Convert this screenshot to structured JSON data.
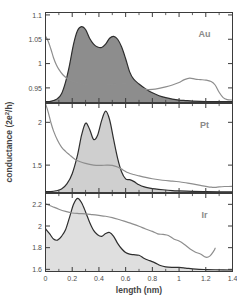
{
  "figure": {
    "xlabel": "length (nm)",
    "ylabel": "conductance (2e²/h)",
    "ylabel_main": "conductance (2e",
    "ylabel_sup": "2",
    "ylabel_tail": "/h)"
  },
  "chart_data": {
    "type": "line",
    "title": "",
    "xlabel": "length (nm)",
    "ylabel": "conductance (2e²/h)",
    "xlim": [
      0,
      1.4
    ],
    "xticks": [
      0,
      0.2,
      0.4,
      0.6,
      0.8,
      1,
      1.2,
      1.4
    ],
    "xticklabels": [
      "0",
      "0.2",
      "0.4",
      "0.6",
      "0.8",
      "1",
      "1.2",
      "1.4"
    ],
    "grid": false,
    "legend": "none",
    "panels": [
      {
        "label": "Au",
        "ylim": [
          0.92,
          1.105
        ],
        "yticks": [
          0.95,
          1,
          1.05,
          1.1
        ],
        "yticklabels": [
          "0.95",
          "1",
          "1.05",
          "1.1"
        ],
        "series": [
          {
            "name": "length histogram (Au)",
            "style": "filled-dark",
            "fill_color": "#8d8d8d",
            "line_color": "#2e2e2e",
            "x": [
              0.0,
              0.03,
              0.06,
              0.09,
              0.12,
              0.15,
              0.18,
              0.21,
              0.24,
              0.27,
              0.3,
              0.33,
              0.36,
              0.39,
              0.42,
              0.45,
              0.48,
              0.51,
              0.54,
              0.57,
              0.6,
              0.63,
              0.66,
              0.7,
              0.75,
              0.8,
              0.85,
              0.9,
              0.95,
              1.0,
              1.05,
              1.1,
              1.2,
              1.3,
              1.4
            ],
            "y": [
              0.922,
              0.922,
              0.924,
              0.928,
              0.938,
              0.962,
              0.997,
              1.04,
              1.068,
              1.076,
              1.07,
              1.052,
              1.04,
              1.034,
              1.033,
              1.04,
              1.052,
              1.056,
              1.05,
              1.034,
              1.01,
              0.983,
              0.968,
              0.958,
              0.948,
              0.94,
              0.934,
              0.93,
              0.927,
              0.925,
              0.924,
              0.923,
              0.922,
              0.922,
              0.922
            ]
          },
          {
            "name": "mean conductance trace (Au)",
            "style": "line-gray",
            "line_color": "#8e8e8e",
            "x": [
              0.0,
              0.02,
              0.04,
              0.06,
              0.08,
              0.1,
              0.13,
              0.16,
              0.2,
              0.25,
              0.3,
              0.35,
              0.4,
              0.45,
              0.5,
              0.55,
              0.6,
              0.65,
              0.7,
              0.75,
              0.8,
              0.85,
              0.9,
              0.95,
              1.0,
              1.04,
              1.08,
              1.12,
              1.16,
              1.2,
              1.24,
              1.27,
              1.3,
              1.33,
              1.36,
              1.4
            ],
            "y": [
              1.056,
              1.046,
              1.03,
              1.012,
              0.998,
              0.988,
              0.977,
              0.97,
              0.964,
              0.96,
              0.957,
              0.956,
              0.956,
              0.956,
              0.957,
              0.958,
              0.959,
              0.957,
              0.951,
              0.947,
              0.947,
              0.949,
              0.952,
              0.956,
              0.961,
              0.967,
              0.97,
              0.968,
              0.967,
              0.966,
              0.963,
              0.956,
              0.941,
              0.93,
              0.926,
              0.925
            ]
          }
        ]
      },
      {
        "label": "Pt",
        "ylim": [
          1.18,
          2.22
        ],
        "yticks": [
          1.5,
          2
        ],
        "yticklabels": [
          "1.5",
          "2"
        ],
        "series": [
          {
            "name": "length histogram (Pt)",
            "style": "filled-light",
            "fill_color": "#cfcfcf",
            "line_color": "#2e2e2e",
            "x": [
              0.0,
              0.04,
              0.08,
              0.12,
              0.16,
              0.2,
              0.24,
              0.27,
              0.3,
              0.33,
              0.36,
              0.39,
              0.42,
              0.45,
              0.48,
              0.51,
              0.54,
              0.57,
              0.6,
              0.63,
              0.66,
              0.7,
              0.74,
              0.78,
              0.82,
              0.88,
              0.95,
              1.0,
              1.1,
              1.2,
              1.3,
              1.4
            ],
            "y": [
              1.19,
              1.19,
              1.2,
              1.22,
              1.28,
              1.4,
              1.62,
              1.85,
              1.99,
              1.92,
              1.8,
              1.85,
              2.02,
              2.13,
              2.03,
              1.8,
              1.58,
              1.42,
              1.34,
              1.33,
              1.31,
              1.27,
              1.245,
              1.232,
              1.222,
              1.212,
              1.203,
              1.199,
              1.193,
              1.19,
              1.188,
              1.188
            ]
          },
          {
            "name": "mean conductance trace (Pt)",
            "style": "line-gray",
            "line_color": "#8e8e8e",
            "x": [
              0.0,
              0.02,
              0.04,
              0.06,
              0.09,
              0.12,
              0.15,
              0.18,
              0.22,
              0.26,
              0.3,
              0.34,
              0.38,
              0.42,
              0.46,
              0.5,
              0.54,
              0.58,
              0.62,
              0.66,
              0.7,
              0.75,
              0.8,
              0.85,
              0.9,
              0.95,
              1.0,
              1.05,
              1.1,
              1.15,
              1.2,
              1.24,
              1.27,
              1.3,
              1.34,
              1.37,
              1.4
            ],
            "y": [
              2.22,
              2.12,
              2.0,
              1.9,
              1.79,
              1.71,
              1.66,
              1.62,
              1.57,
              1.54,
              1.52,
              1.505,
              1.497,
              1.497,
              1.5,
              1.497,
              1.478,
              1.444,
              1.41,
              1.39,
              1.374,
              1.356,
              1.341,
              1.329,
              1.32,
              1.314,
              1.306,
              1.294,
              1.28,
              1.266,
              1.252,
              1.242,
              1.24,
              1.246,
              1.25,
              1.25,
              1.252
            ]
          }
        ]
      },
      {
        "label": "Ir",
        "ylim": [
          1.58,
          2.3
        ],
        "yticks": [
          1.6,
          1.8,
          2,
          2.2
        ],
        "yticklabels": [
          "1.6",
          "1.8",
          "2",
          "2.2"
        ],
        "series": [
          {
            "name": "length histogram (Ir)",
            "style": "filled-light",
            "fill_color": "#dfdfdf",
            "line_color": "#2e2e2e",
            "x": [
              0.0,
              0.03,
              0.06,
              0.09,
              0.12,
              0.15,
              0.18,
              0.21,
              0.24,
              0.27,
              0.3,
              0.33,
              0.36,
              0.39,
              0.42,
              0.45,
              0.48,
              0.51,
              0.54,
              0.57,
              0.6,
              0.63,
              0.66,
              0.7,
              0.74,
              0.78,
              0.82,
              0.86,
              0.9,
              0.95,
              1.0,
              1.05,
              1.1,
              1.15,
              1.2,
              1.27,
              1.4
            ],
            "y": [
              1.975,
              1.93,
              1.88,
              1.87,
              1.905,
              1.965,
              2.08,
              2.2,
              2.255,
              2.215,
              2.13,
              2.035,
              1.96,
              1.92,
              1.905,
              1.93,
              1.94,
              1.905,
              1.84,
              1.79,
              1.755,
              1.74,
              1.735,
              1.73,
              1.7,
              1.68,
              1.66,
              1.635,
              1.622,
              1.618,
              1.618,
              1.612,
              1.605,
              1.6,
              1.598,
              1.596,
              1.594
            ]
          },
          {
            "name": "mean conductance trace (Ir)",
            "style": "line-gray",
            "line_color": "#8e8e8e",
            "x": [
              0.0,
              0.05,
              0.1,
              0.15,
              0.2,
              0.25,
              0.3,
              0.35,
              0.4,
              0.45,
              0.5,
              0.55,
              0.6,
              0.65,
              0.7,
              0.75,
              0.8,
              0.84,
              0.88,
              0.92,
              0.96,
              1.0,
              1.04,
              1.08,
              1.12,
              1.16,
              1.2,
              1.23,
              1.26,
              1.27
            ],
            "y": [
              2.205,
              2.18,
              2.155,
              2.135,
              2.12,
              2.115,
              2.112,
              2.105,
              2.098,
              2.09,
              2.078,
              2.06,
              2.04,
              2.02,
              1.998,
              1.972,
              1.95,
              1.928,
              1.922,
              1.912,
              1.88,
              1.862,
              1.83,
              1.79,
              1.76,
              1.742,
              1.712,
              1.722,
              1.77,
              1.795
            ]
          }
        ]
      }
    ]
  }
}
